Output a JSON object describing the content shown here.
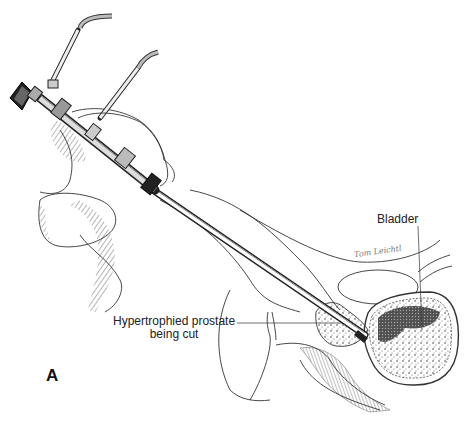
{
  "figure": {
    "panel_label": "A",
    "labels": {
      "bladder": "Bladder",
      "prostate_line1": "Hypertrophied prostate",
      "prostate_line2": "being cut"
    },
    "signature": "Tom Leichtl",
    "colors": {
      "background": "#ffffff",
      "ink": "#222222",
      "shading": "#555555",
      "label_text": "#222222"
    },
    "elements": [
      "resectoscope-eyepiece",
      "resectoscope-shaft",
      "irrigation-inflow-port",
      "irrigation-outflow-port",
      "surgeon-hand",
      "bladder",
      "prostate",
      "pubic-symphysis",
      "rectum"
    ]
  }
}
